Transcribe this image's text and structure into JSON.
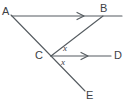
{
  "figure": {
    "type": "geometry-diagram",
    "background_color": "#ffffff",
    "stroke_color": "#555b60",
    "text_color": "#3d4145"
  },
  "points": {
    "A": {
      "label": "A",
      "x": 5,
      "y": 12
    },
    "B": {
      "label": "B",
      "x": 105,
      "y": 9
    },
    "C": {
      "label": "C",
      "x": 40,
      "y": 56
    },
    "D": {
      "label": "D",
      "x": 119,
      "y": 56
    },
    "E": {
      "label": "E",
      "x": 90,
      "y": 96
    }
  },
  "angles": {
    "upper": {
      "label": "x",
      "between": "CB and CD"
    },
    "lower": {
      "label": "x",
      "between": "CD and CE"
    }
  },
  "rays": [
    {
      "name": "ray-AB",
      "from": "A",
      "to": "B",
      "arrow": true,
      "arrow_at_x": 82
    },
    {
      "name": "ray-CD",
      "from": "C",
      "to": "D",
      "arrow": true,
      "arrow_at_x": 86
    }
  ],
  "segments": [
    {
      "name": "segment-A-C",
      "from": "A",
      "to": "C"
    },
    {
      "name": "segment-C-B",
      "from": "C",
      "to": "B"
    },
    {
      "name": "segment-C-E",
      "from": "C",
      "to": "E"
    }
  ]
}
